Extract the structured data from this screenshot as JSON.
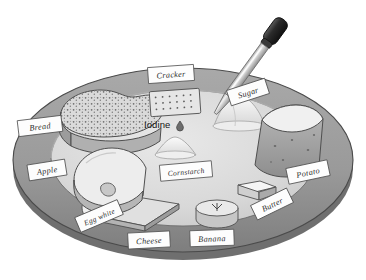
{
  "illustration": {
    "title": "Iodine test on a tray of food samples",
    "tray": {
      "name": "tray",
      "rim_color": "#9a9a9a",
      "rim_shadow_color": "#6f6f6f",
      "inner_color": "#dcdcdc",
      "outline_color": "#4a4a4a"
    },
    "tool": {
      "name": "eyedropper",
      "label": "Iodine",
      "bulb_color": "#2e2e2e",
      "glass_color": "#cfcfcf",
      "drop_icon": "drop-icon"
    },
    "items": [
      {
        "id": "bread",
        "label": "Bread",
        "label_x": 18,
        "label_y": 118,
        "label_rot": -7,
        "label_w": 44,
        "label_h": 16
      },
      {
        "id": "cracker",
        "label": "Cracker",
        "label_x": 148,
        "label_y": 66,
        "label_rot": -4,
        "label_w": 46,
        "label_h": 16
      },
      {
        "id": "sugar",
        "label": "Sugar",
        "label_x": 228,
        "label_y": 84,
        "label_rot": -18,
        "label_w": 40,
        "label_h": 16
      },
      {
        "id": "potato",
        "label": "Potato",
        "label_x": 287,
        "label_y": 164,
        "label_rot": -12,
        "label_w": 42,
        "label_h": 16
      },
      {
        "id": "butter",
        "label": "Butter",
        "label_x": 252,
        "label_y": 196,
        "label_rot": -26,
        "label_w": 40,
        "label_h": 16
      },
      {
        "id": "banana",
        "label": "Banana",
        "label_x": 190,
        "label_y": 230,
        "label_rot": -2,
        "label_w": 44,
        "label_h": 16
      },
      {
        "id": "cheese",
        "label": "Cheese",
        "label_x": 128,
        "label_y": 232,
        "label_rot": -3,
        "label_w": 42,
        "label_h": 16
      },
      {
        "id": "egg-white",
        "label": "Egg white",
        "label_x": 76,
        "label_y": 208,
        "label_rot": -23,
        "label_w": 46,
        "label_h": 16
      },
      {
        "id": "apple",
        "label": "Apple",
        "label_x": 28,
        "label_y": 162,
        "label_rot": -9,
        "label_w": 38,
        "label_h": 16
      },
      {
        "id": "cornstarch",
        "label": "Cornstarch",
        "label_x": 160,
        "label_y": 163,
        "label_rot": -5,
        "label_w": 52,
        "label_h": 16
      }
    ]
  }
}
